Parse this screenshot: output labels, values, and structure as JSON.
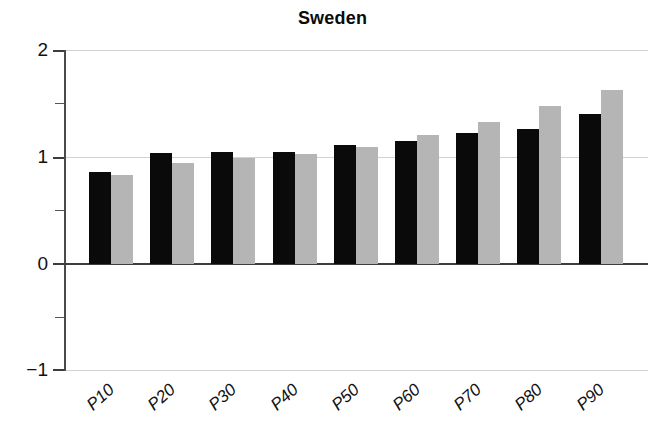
{
  "chart_data": {
    "type": "bar",
    "title": "Sweden",
    "xlabel": "",
    "ylabel": "",
    "categories": [
      "P10",
      "P20",
      "P30",
      "P40",
      "P50",
      "P60",
      "P70",
      "P80",
      "P90"
    ],
    "series": [
      {
        "name": "black",
        "color": "#0a0a0a",
        "values": [
          0.86,
          1.04,
          1.05,
          1.05,
          1.12,
          1.15,
          1.23,
          1.27,
          1.41
        ]
      },
      {
        "name": "gray",
        "color": "#b5b5b5",
        "values": [
          0.83,
          0.95,
          0.99,
          1.03,
          1.1,
          1.21,
          1.33,
          1.48,
          1.63
        ]
      }
    ],
    "ylim": [
      -1,
      2
    ],
    "yticks": [
      2,
      1,
      0,
      -1
    ],
    "ytick_labels": [
      "2",
      "1",
      "0",
      "−1"
    ],
    "yminor_ticks": [
      1.5,
      0.5,
      -0.5
    ],
    "grid": true,
    "grid_axis": "y",
    "legend": "none",
    "baseline_value": 0
  }
}
